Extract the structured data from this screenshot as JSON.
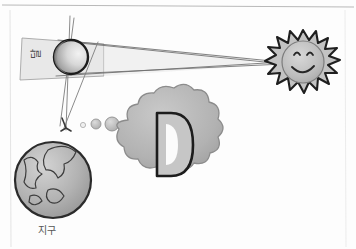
{
  "figure": {
    "kind": "hand-drawn-diagram",
    "background_color": "#fdfdfd",
    "ink_color": "#2b2b2b"
  },
  "frame": {
    "top_rule": true,
    "left_rule": true,
    "right_rule": true,
    "rule_color": "#b9b9b9"
  },
  "labels": {
    "moon": "달",
    "earth": "지구",
    "cloud_letter": "D"
  },
  "bodies": {
    "sun": {
      "name": "sun",
      "cx": 303,
      "cy": 62,
      "r": 24,
      "fill": "#b8b8b8",
      "stroke": "#2b2b2b",
      "ray_count": 20,
      "has_face": true,
      "face": {
        "expression": "smile",
        "eyes": 2
      }
    },
    "moon": {
      "name": "moon",
      "cx": 71,
      "cy": 57,
      "r": 17,
      "fill_light": "#e9e9e9",
      "fill_dark": "#8d8d8d",
      "stroke": "#1f1f1f"
    },
    "earth": {
      "name": "earth",
      "cx": 53,
      "cy": 180,
      "r": 38,
      "fill": "#b0b0b0",
      "stroke": "#2b2b2b",
      "has_continents": true
    },
    "small_circles": [
      {
        "cx": 83,
        "cy": 125,
        "r": 2.5,
        "fill": "#ededed"
      },
      {
        "cx": 96,
        "cy": 124,
        "r": 5,
        "fill": "#b6b6b6"
      },
      {
        "cx": 112,
        "cy": 124,
        "r": 7,
        "fill": "#c2c2c2"
      }
    ]
  },
  "cloud": {
    "name": "thought-cloud",
    "cx": 166,
    "cy": 143,
    "fill": "#b4b4b4",
    "stroke": "#8a8a8a",
    "letter": "D",
    "letter_color": "#1f1f1f"
  },
  "shadow_cone": {
    "name": "umbra-wedge",
    "fill": "#e6e6e6",
    "stroke": "#8f8f8f",
    "description": "light wedge extending left from the moon"
  },
  "ray_lines": {
    "name": "sun-to-moon-tangents",
    "stroke": "#6b6b6b",
    "count": 4
  },
  "axis_lines": {
    "name": "vertical-sight-lines",
    "stroke": "#7a7a7a",
    "count": 3
  }
}
